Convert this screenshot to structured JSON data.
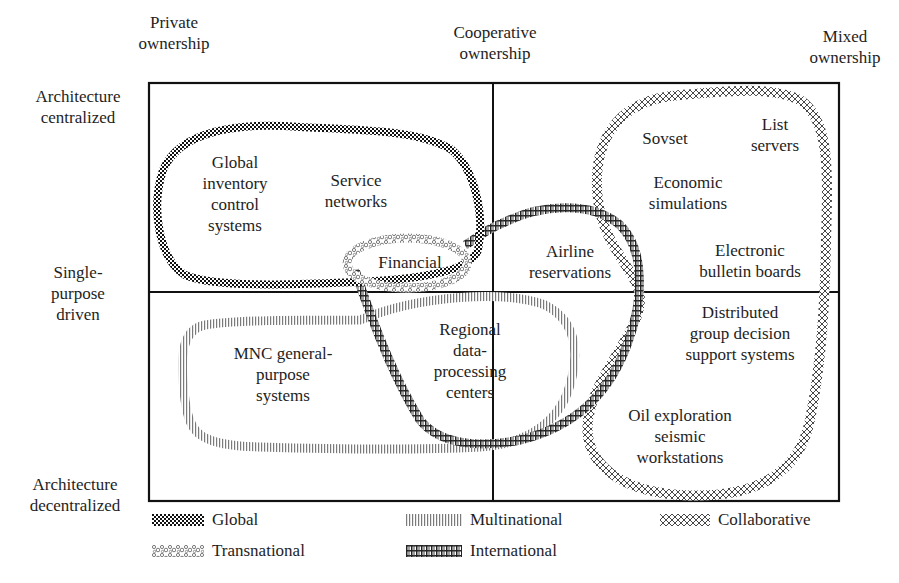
{
  "axes": {
    "top": [
      {
        "id": "private",
        "lines": [
          "Private",
          "ownership"
        ]
      },
      {
        "id": "cooperative",
        "lines": [
          "Cooperative",
          "ownership"
        ]
      },
      {
        "id": "mixed",
        "lines": [
          "Mixed",
          "ownership"
        ]
      }
    ],
    "left": [
      {
        "id": "centralized",
        "lines": [
          "Architecture",
          "centralized"
        ]
      },
      {
        "id": "single-purpose",
        "lines": [
          "Single-",
          "purpose",
          "driven"
        ]
      },
      {
        "id": "decentralized",
        "lines": [
          "Architecture",
          "decentralized"
        ]
      }
    ]
  },
  "nodes": [
    {
      "id": "global-inventory",
      "lines": [
        "Global",
        "inventory",
        "control",
        "systems"
      ],
      "group": "Global"
    },
    {
      "id": "service-networks",
      "lines": [
        "Service",
        "networks"
      ],
      "group": "Global"
    },
    {
      "id": "financial",
      "lines": [
        "Financial"
      ],
      "group": "Transnational"
    },
    {
      "id": "airline",
      "lines": [
        "Airline",
        "reservations"
      ],
      "group": "International"
    },
    {
      "id": "sovset",
      "lines": [
        "Sovset"
      ],
      "group": "Collaborative"
    },
    {
      "id": "list-servers",
      "lines": [
        "List",
        "servers"
      ],
      "group": "Collaborative"
    },
    {
      "id": "economic-sim",
      "lines": [
        "Economic",
        "simulations"
      ],
      "group": "Collaborative"
    },
    {
      "id": "ebb",
      "lines": [
        "Electronic",
        "bulletin boards"
      ],
      "group": "Collaborative"
    },
    {
      "id": "mnc",
      "lines": [
        "MNC general-",
        "purpose",
        "systems"
      ],
      "group": "Multinational"
    },
    {
      "id": "regional",
      "lines": [
        "Regional",
        "data-",
        "processing",
        "centers"
      ],
      "group": "International"
    },
    {
      "id": "dgdss",
      "lines": [
        "Distributed",
        "group decision",
        "support systems"
      ],
      "group": "Collaborative"
    },
    {
      "id": "oil",
      "lines": [
        "Oil exploration",
        "seismic",
        "workstations"
      ],
      "group": "Collaborative"
    }
  ],
  "legend": [
    {
      "id": "global",
      "label": "Global",
      "pattern": "checker"
    },
    {
      "id": "transnational",
      "label": "Transnational",
      "pattern": "pebble"
    },
    {
      "id": "multinational",
      "label": "Multinational",
      "pattern": "vertical-lines"
    },
    {
      "id": "international",
      "label": "International",
      "pattern": "hash"
    },
    {
      "id": "collaborative",
      "label": "Collaborative",
      "pattern": "crosshatch"
    }
  ],
  "colors": {
    "ink": "#1e1e1e",
    "multinational": "#8a8a8a",
    "background": "#ffffff"
  }
}
